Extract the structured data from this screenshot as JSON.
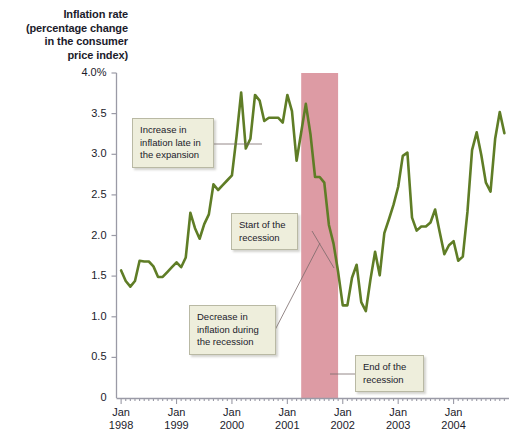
{
  "figure": {
    "background_color": "#ffffff",
    "line_color": "#5f7d26",
    "recession_band_color": "#dd9ba4",
    "callout_bg": "#eeeedc",
    "callout_border": "#b9b9a4"
  },
  "axis_title": {
    "line1": "Inflation rate",
    "line2": "(percentage change",
    "line3": "in the consumer",
    "line4": "price index)"
  },
  "chart_data": {
    "type": "line",
    "title": "Inflation rate (percentage change in the consumer price index)",
    "xlabel": "",
    "ylabel": "Inflation rate (percentage change in the consumer price index)",
    "ylim": [
      0,
      4.0
    ],
    "xlim": [
      "1998-01",
      "2004-12"
    ],
    "grid": false,
    "legend": "none",
    "y_ticks": [
      "0",
      "0.5",
      "1.0",
      "1.5",
      "2.0",
      "2.5",
      "3.0",
      "3.5",
      "4.0%"
    ],
    "y_tick_values": [
      0,
      0.5,
      1.0,
      1.5,
      2.0,
      2.5,
      3.0,
      3.5,
      4.0
    ],
    "x_ticks": [
      {
        "month": "Jan",
        "year": "1998"
      },
      {
        "month": "Jan",
        "year": "1999"
      },
      {
        "month": "Jan",
        "year": "2000"
      },
      {
        "month": "Jan",
        "year": "2001"
      },
      {
        "month": "Jan",
        "year": "2002"
      },
      {
        "month": "Jan",
        "year": "2003"
      },
      {
        "month": "Jan",
        "year": "2004"
      }
    ],
    "series": [
      {
        "name": "Inflation rate (CPI, percent change)",
        "color": "#5f7d26",
        "x": [
          "1998-01",
          "1998-02",
          "1998-03",
          "1998-04",
          "1998-05",
          "1998-06",
          "1998-07",
          "1998-08",
          "1998-09",
          "1998-10",
          "1998-11",
          "1998-12",
          "1999-01",
          "1999-02",
          "1999-03",
          "1999-04",
          "1999-05",
          "1999-06",
          "1999-07",
          "1999-08",
          "1999-09",
          "1999-10",
          "1999-11",
          "1999-12",
          "2000-01",
          "2000-02",
          "2000-03",
          "2000-04",
          "2000-05",
          "2000-06",
          "2000-07",
          "2000-08",
          "2000-09",
          "2000-10",
          "2000-11",
          "2000-12",
          "2001-01",
          "2001-02",
          "2001-03",
          "2001-04",
          "2001-05",
          "2001-06",
          "2001-07",
          "2001-08",
          "2001-09",
          "2001-10",
          "2001-11",
          "2001-12",
          "2002-01",
          "2002-02",
          "2002-03",
          "2002-04",
          "2002-05",
          "2002-06",
          "2002-07",
          "2002-08",
          "2002-09",
          "2002-10",
          "2002-11",
          "2002-12",
          "2003-01",
          "2003-02",
          "2003-03",
          "2003-04",
          "2003-05",
          "2003-06",
          "2003-07",
          "2003-08",
          "2003-09",
          "2003-10",
          "2003-11",
          "2003-12",
          "2004-01",
          "2004-02",
          "2004-03",
          "2004-04",
          "2004-05",
          "2004-06",
          "2004-07",
          "2004-08",
          "2004-09",
          "2004-10",
          "2004-11",
          "2004-12"
        ],
        "values": [
          1.57,
          1.44,
          1.37,
          1.44,
          1.69,
          1.68,
          1.68,
          1.62,
          1.49,
          1.49,
          1.55,
          1.61,
          1.67,
          1.61,
          1.73,
          2.28,
          2.09,
          1.96,
          2.14,
          2.26,
          2.63,
          2.56,
          2.62,
          2.68,
          2.74,
          3.22,
          3.76,
          3.07,
          3.19,
          3.73,
          3.66,
          3.41,
          3.45,
          3.45,
          3.45,
          3.39,
          3.73,
          3.53,
          2.92,
          3.27,
          3.62,
          3.25,
          2.72,
          2.72,
          2.65,
          2.13,
          1.9,
          1.55,
          1.14,
          1.14,
          1.48,
          1.64,
          1.18,
          1.07,
          1.46,
          1.8,
          1.51,
          2.03,
          2.2,
          2.38,
          2.6,
          2.98,
          3.02,
          2.22,
          2.06,
          2.11,
          2.11,
          2.16,
          2.32,
          2.04,
          1.77,
          1.88,
          1.93,
          1.69,
          1.74,
          2.29,
          3.05,
          3.27,
          2.99,
          2.65,
          2.54,
          3.19,
          3.52,
          3.26
        ]
      }
    ],
    "shaded_regions": [
      {
        "name": "recession",
        "label": "recession band",
        "start": "2001-04",
        "end": "2001-12",
        "color": "#dd9ba4"
      }
    ],
    "annotations": [
      {
        "id": "increase-expansion",
        "text": "Increase in\ninflation late in\nthe expansion"
      },
      {
        "id": "start-recession",
        "text": "Start of the\nrecession"
      },
      {
        "id": "decrease-recession",
        "text": "Decrease in\ninflation during\nthe recession"
      },
      {
        "id": "end-recession",
        "text": "End of the\nrecession"
      }
    ]
  }
}
